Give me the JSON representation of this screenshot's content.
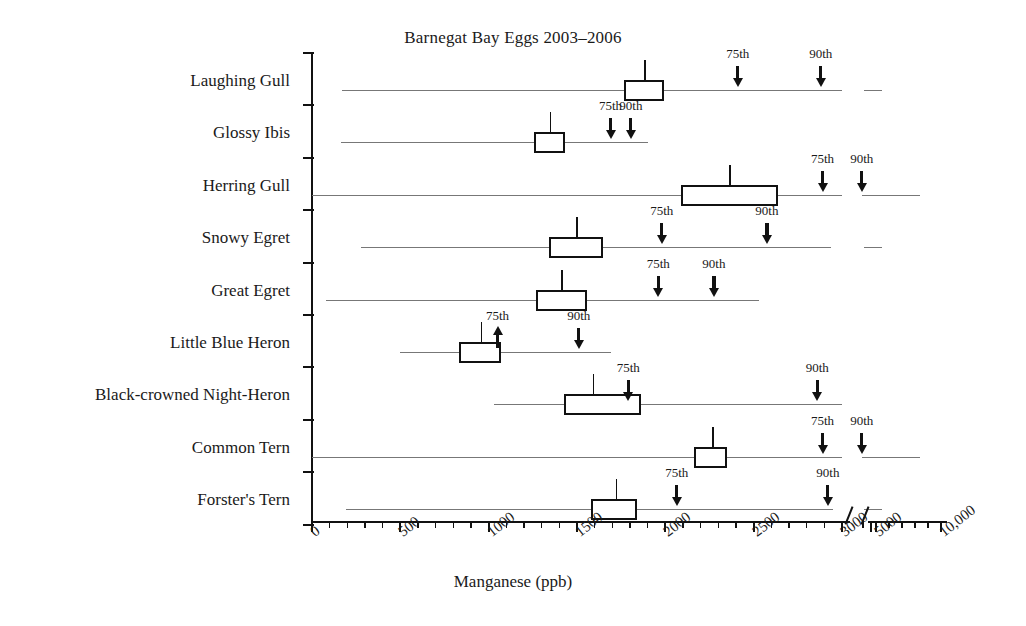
{
  "chart_data": {
    "type": "box",
    "title": "Barnegat Bay Eggs 2003–2006",
    "xlabel": "Manganese (ppb)",
    "ylabel": "",
    "xticks": [
      {
        "label": "0",
        "value": 0
      },
      {
        "label": "500",
        "value": 500
      },
      {
        "label": "1000",
        "value": 1000
      },
      {
        "label": "1500",
        "value": 1500
      },
      {
        "label": "2000",
        "value": 2000
      },
      {
        "label": "2500",
        "value": 2500
      },
      {
        "label": "3000",
        "value": 3000
      },
      {
        "label": "5000",
        "value": 5000
      },
      {
        "label": "10,000",
        "value": 10000
      }
    ],
    "axis_break": true,
    "grid": false,
    "legend": "none",
    "percentile_labels": {
      "p75": "75th",
      "p90": "90th"
    },
    "categories": [
      "Laughing Gull",
      "Glossy Ibis",
      "Herring Gull",
      "Snowy Egret",
      "Great Egret",
      "Little Blue Heron",
      "Black-crowned Night-Heron",
      "Common Tern",
      "Forster's Tern"
    ],
    "series": [
      {
        "name": "Laughing Gull",
        "whisker_low": 170,
        "whisker_high": 3000,
        "q1": 1765,
        "q3": 1995,
        "median": 1880,
        "p75": 2410,
        "p75_dir": "down",
        "p90": 2880,
        "p90_dir": "down",
        "extra_segment": true
      },
      {
        "name": "Glossy Ibis",
        "whisker_low": 165,
        "whisker_high": 1900,
        "q1": 1255,
        "q3": 1430,
        "median": 1345,
        "p75": 1690,
        "p75_dir": "down",
        "p90": 1805,
        "p90_dir": "down",
        "extra_segment": false
      },
      {
        "name": "Herring Gull",
        "whisker_low": 0,
        "whisker_high": 3000,
        "q1": 2090,
        "q3": 2640,
        "median": 2360,
        "p75": 2890,
        "p75_dir": "down",
        "p90": 3900,
        "p90_dir": "down",
        "extra_segment": true
      },
      {
        "name": "Snowy Egret",
        "whisker_low": 280,
        "whisker_high": 2940,
        "q1": 1340,
        "q3": 1650,
        "median": 1495,
        "p75": 1980,
        "p75_dir": "down",
        "p90": 2575,
        "p90_dir": "down",
        "extra_segment": true
      },
      {
        "name": "Great Egret",
        "whisker_low": 80,
        "whisker_high": 2530,
        "q1": 1270,
        "q3": 1555,
        "median": 1410,
        "p75": 1960,
        "p75_dir": "down",
        "p90": 2275,
        "p90_dir": "down",
        "extra_segment": false
      },
      {
        "name": "Little Blue Heron",
        "whisker_low": 500,
        "whisker_high": 1690,
        "q1": 830,
        "q3": 1070,
        "median": 955,
        "p75": 1050,
        "p75_dir": "up",
        "p90": 1510,
        "p90_dir": "down",
        "extra_segment": false
      },
      {
        "name": "Black-crowned Night-Heron",
        "whisker_low": 1030,
        "whisker_high": 3000,
        "q1": 1425,
        "q3": 1865,
        "median": 1590,
        "p75": 1790,
        "p75_dir": "down",
        "p90": 2860,
        "p90_dir": "down",
        "extra_segment": false
      },
      {
        "name": "Common Tern",
        "whisker_low": 0,
        "whisker_high": 3000,
        "q1": 2160,
        "q3": 2350,
        "median": 2265,
        "p75": 2890,
        "p75_dir": "down",
        "p90": 3900,
        "p90_dir": "down",
        "extra_segment": true
      },
      {
        "name": "Forster's Tern",
        "whisker_low": 190,
        "whisker_high": 2950,
        "q1": 1580,
        "q3": 1840,
        "median": 1720,
        "p75": 2065,
        "p75_dir": "down",
        "p90": 2920,
        "p90_dir": "down",
        "extra_segment": true
      }
    ]
  },
  "colors": {
    "ink": "#111111",
    "whisker": "#777777",
    "background": "#ffffff"
  }
}
